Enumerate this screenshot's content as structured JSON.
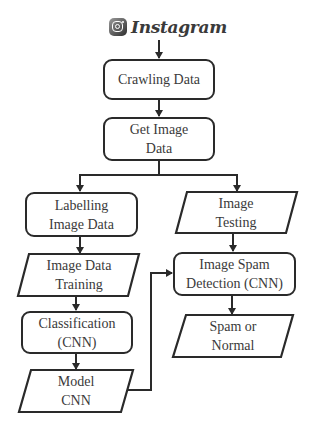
{
  "logo": {
    "icon": "instagram-icon",
    "text": "Instagram"
  },
  "nodes": {
    "crawling": {
      "shape": "rounded-rect",
      "lines": [
        "Crawling Data"
      ]
    },
    "get_image": {
      "shape": "rounded-rect",
      "lines": [
        "Get Image",
        "Data"
      ]
    },
    "labelling": {
      "shape": "rounded-rect",
      "lines": [
        "Labelling",
        "Image Data"
      ]
    },
    "training": {
      "shape": "parallelogram",
      "lines": [
        "Image Data",
        "Training"
      ]
    },
    "classification": {
      "shape": "rounded-rect",
      "lines": [
        "Classification",
        "(CNN)"
      ]
    },
    "model": {
      "shape": "parallelogram",
      "lines": [
        "Model",
        "CNN"
      ]
    },
    "testing": {
      "shape": "parallelogram",
      "lines": [
        "Image",
        "Testing"
      ]
    },
    "detection": {
      "shape": "rounded-rect",
      "lines": [
        "Image Spam",
        "Detection (CNN)"
      ]
    },
    "result": {
      "shape": "parallelogram",
      "lines": [
        "Spam or",
        "Normal"
      ]
    }
  },
  "edges": [
    [
      "Instagram",
      "Crawling Data"
    ],
    [
      "Crawling Data",
      "Get Image Data"
    ],
    [
      "Get Image Data",
      "Labelling Image Data"
    ],
    [
      "Get Image Data",
      "Image Testing"
    ],
    [
      "Labelling Image Data",
      "Image Data Training"
    ],
    [
      "Image Data Training",
      "Classification (CNN)"
    ],
    [
      "Classification (CNN)",
      "Model CNN"
    ],
    [
      "Model CNN",
      "Image Spam Detection (CNN)"
    ],
    [
      "Image Testing",
      "Image Spam Detection (CNN)"
    ],
    [
      "Image Spam Detection (CNN)",
      "Spam or Normal"
    ]
  ],
  "colors": {
    "stroke": "#2a2a2a",
    "text": "#3a3a3a",
    "background": "#ffffff"
  }
}
